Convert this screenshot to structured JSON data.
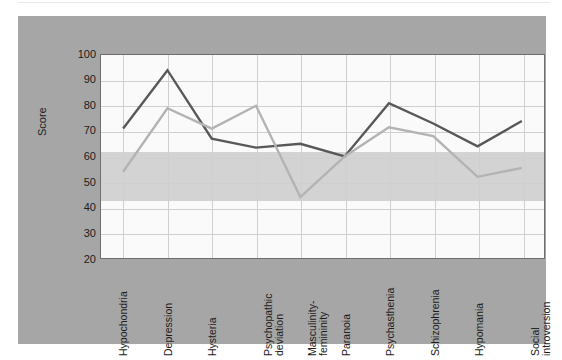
{
  "figure": {
    "background_color": "#a6a6a6",
    "plot_background_color": "#fafafa",
    "band_color": "#cbcbcb",
    "gridline_color": "#cfcfcf",
    "axis_border_color": "#6e6e6e"
  },
  "chart_data": {
    "type": "line",
    "title": "",
    "xlabel": "",
    "ylabel": "Score",
    "ylim": [
      20,
      100
    ],
    "yticks": [
      100,
      90,
      80,
      70,
      60,
      50,
      40,
      30,
      20
    ],
    "grid": true,
    "legend": "none",
    "normal_band": {
      "from": 43,
      "to": 62,
      "color": "#cbcbcb"
    },
    "categories": [
      "Hypochondria",
      "Depression",
      "Hysteria",
      "Psychopathic deviation",
      "Masculinity-femininity",
      "Paranoia",
      "Psychasthenia",
      "Schizophrenia",
      "Hypomania",
      "Social introversion"
    ],
    "category_lines": [
      [
        "Hypochondria"
      ],
      [
        "Depression"
      ],
      [
        "Hysteria"
      ],
      [
        "Psychopathic",
        "deviation"
      ],
      [
        "Masculinity-",
        "femininity"
      ],
      [
        "Paranoia"
      ],
      [
        "Psychasthenia"
      ],
      [
        "Schizophrenia"
      ],
      [
        "Hypomania"
      ],
      [
        "Social",
        "introversion"
      ]
    ],
    "series": [
      {
        "name": "Series 1",
        "color": "#585858",
        "width": 2.4,
        "values": [
          71,
          94,
          67,
          63.5,
          65,
          60,
          81,
          73,
          64,
          74
        ]
      },
      {
        "name": "Series 2",
        "color": "#b3b3b3",
        "width": 2.4,
        "values": [
          54,
          79,
          71,
          80,
          44,
          60,
          71.5,
          68,
          52,
          55.5
        ]
      }
    ]
  }
}
